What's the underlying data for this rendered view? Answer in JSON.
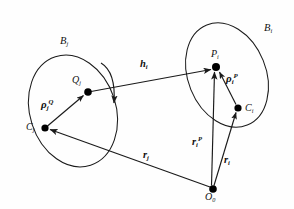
{
  "figure": {
    "caption": "",
    "bodies": [
      {
        "id": "Bj",
        "label": "B",
        "sub": "j",
        "role": "left-body-outline"
      },
      {
        "id": "Bi",
        "label": "B",
        "sub": "i",
        "role": "right-body-outline"
      }
    ],
    "points": [
      {
        "id": "Cj",
        "label": "C",
        "sub": "j",
        "role": "left-body-center",
        "x": 45,
        "y": 128
      },
      {
        "id": "Qj",
        "label": "Q",
        "sub": "j",
        "role": "left-body-contact-point",
        "x": 88,
        "y": 92
      },
      {
        "id": "Pi",
        "label": "P",
        "sub": "i",
        "role": "right-body-contact-point",
        "x": 216,
        "y": 67
      },
      {
        "id": "Ci",
        "label": "C",
        "sub": "i",
        "role": "right-body-center",
        "x": 238,
        "y": 108
      },
      {
        "id": "O0",
        "label": "O",
        "sub": "0",
        "role": "global-origin",
        "x": 213,
        "y": 189
      }
    ],
    "vectors": [
      {
        "id": "hi",
        "label": "h",
        "sub": "i",
        "sup": "",
        "from": "Qj",
        "to": "Pi",
        "desc": "gap-vector"
      },
      {
        "id": "rhojQ",
        "label": "ρ",
        "sub": "j",
        "sup": "Q",
        "from": "Cj",
        "to": "Qj",
        "desc": "left-body-local-position-vector"
      },
      {
        "id": "rhoiP",
        "label": "ρ",
        "sub": "i",
        "sup": "P",
        "from": "Ci",
        "to": "Pi",
        "desc": "right-body-local-position-vector"
      },
      {
        "id": "rj",
        "label": "r",
        "sub": "j",
        "sup": "",
        "from": "O0",
        "to": "Cj",
        "desc": "left-body-center-position-vector"
      },
      {
        "id": "ri",
        "label": "r",
        "sub": "i",
        "sup": "",
        "from": "O0",
        "to": "Ci",
        "desc": "right-body-center-position-vector"
      },
      {
        "id": "riP",
        "label": "r",
        "sub": "i",
        "sup": "P",
        "from": "O0",
        "to": "Pi",
        "desc": "contact-point-position-vector"
      }
    ],
    "annotations": [
      {
        "id": "rotation-arc",
        "desc": "curved-rotation-arrow-near-Qj"
      }
    ],
    "labels": {
      "Bj": {
        "text": "B",
        "sub": "j"
      },
      "Bi": {
        "text": "B",
        "sub": "i"
      },
      "Cj": {
        "text": "C",
        "sub": "j"
      },
      "Ci": {
        "text": "C",
        "sub": "i"
      },
      "Qj": {
        "text": "Q",
        "sub": "j"
      },
      "Pi": {
        "text": "P",
        "sub": "i"
      },
      "O0": {
        "text": "O",
        "sub": "0"
      },
      "hi": {
        "text": "h",
        "sub": "i"
      },
      "rj": {
        "text": "r",
        "sub": "j"
      },
      "ri": {
        "text": "r",
        "sub": "i"
      },
      "riP": {
        "text": "r",
        "sub": "i",
        "sup": "P"
      },
      "rhojQ": {
        "text": "ρ",
        "sub": "j",
        "sup": "Q"
      },
      "rhoiP": {
        "text": "ρ",
        "sub": "i",
        "sup": "P"
      }
    },
    "colors": {
      "stroke": "#1a1a1a",
      "node_fill": "#000000",
      "background": "#fefefe",
      "text": "#111111"
    }
  }
}
